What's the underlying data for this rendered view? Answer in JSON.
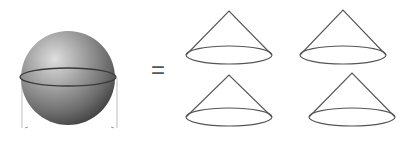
{
  "diagram": {
    "description": "Volume of sphere equals volume of four cones",
    "colors": {
      "background": "#ffffff",
      "stroke": "#555555",
      "sphere_light": "#d6d6d6",
      "sphere_mid": "#9a9a9a",
      "sphere_dark": "#3c3c3c",
      "guide": "#bbbbbb"
    },
    "sphere": {
      "cx": 68,
      "cy": 78,
      "r": 47,
      "equator_rx": 48,
      "equator_ry": 9
    },
    "guides": {
      "left_x": 22,
      "right_x": 117,
      "y_top": 78,
      "y_bottom": 128
    },
    "operator": "=",
    "cones": [
      {
        "id": "cone-top-left",
        "apex_x": 229,
        "apex_y": 11,
        "base_cx": 229,
        "base_cy": 55,
        "rx": 43,
        "ry": 9
      },
      {
        "id": "cone-top-right",
        "apex_x": 343,
        "apex_y": 10,
        "base_cx": 343,
        "base_cy": 55,
        "rx": 43,
        "ry": 9
      },
      {
        "id": "cone-bottom-left",
        "apex_x": 229,
        "apex_y": 75,
        "base_cx": 229,
        "base_cy": 117,
        "rx": 43,
        "ry": 9
      },
      {
        "id": "cone-bottom-right",
        "apex_x": 352,
        "apex_y": 73,
        "base_cx": 352,
        "base_cy": 117,
        "rx": 43,
        "ry": 9
      }
    ]
  }
}
